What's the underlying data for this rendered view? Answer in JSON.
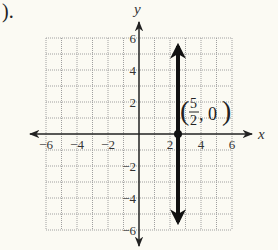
{
  "problem": {
    "part_label": ")."
  },
  "graph": {
    "x_axis_label": "x",
    "y_axis_label": "y",
    "x_ticks": [
      "−6",
      "−4",
      "−2",
      "2",
      "4",
      "6"
    ],
    "y_ticks": [
      "6",
      "4",
      "2",
      "−2",
      "−4",
      "−6"
    ],
    "point_label": {
      "open": "(",
      "numerator": "5",
      "denominator": "2",
      "rest": ", 0",
      "close": ")"
    },
    "line_description": "vertical line x = 5/2",
    "colors": {
      "grid": "#9a9a9a",
      "axis": "#222222",
      "line": "#111111",
      "background": "#fbfaf3"
    }
  },
  "chart_data": {
    "type": "line",
    "title": "",
    "xlabel": "x",
    "ylabel": "y",
    "xlim": [
      -6,
      6
    ],
    "ylim": [
      -6,
      6
    ],
    "grid": true,
    "x_ticks": [
      -6,
      -4,
      -2,
      2,
      4,
      6
    ],
    "y_ticks": [
      -6,
      -4,
      -2,
      2,
      4,
      6
    ],
    "series": [
      {
        "name": "x = 5/2",
        "x": [
          2.5,
          2.5
        ],
        "y": [
          -6,
          6
        ],
        "arrows": "both"
      }
    ],
    "points": [
      {
        "x": 2.5,
        "y": 0,
        "label": "(5/2, 0)"
      }
    ]
  }
}
